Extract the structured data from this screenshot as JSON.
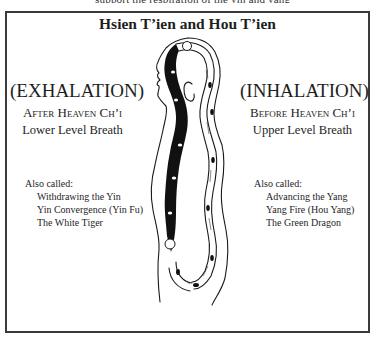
{
  "top_cut_text": "support the respiration of the yin and yang",
  "title": "Hsien T’ien and Hou T’ien",
  "left": {
    "heading": "(EXHALATION)",
    "subheading": "After Heaven Ch’i",
    "description": "Lower Level Breath",
    "also_called_label": "Also called:",
    "also_called": [
      "Withdrawing the Yin",
      "Yin Convergence (Yin Fu)",
      "The White Tiger"
    ]
  },
  "right": {
    "heading": "(INHALATION)",
    "subheading": "Before Heaven Ch’i",
    "description": "Upper Level Breath",
    "also_called_label": "Also called:",
    "also_called": [
      "Advancing the Yang",
      "Yang Fire (Hou Yang)",
      "The Green Dragon"
    ]
  },
  "figure": {
    "channels": [
      {
        "name": "front-channel-dark",
        "fill": "#111111"
      },
      {
        "name": "back-channel-light",
        "fill": "#ffffff"
      }
    ],
    "colors": {
      "ink": "#1a1a1a",
      "frame": "#3a3a3a",
      "background": "#ffffff"
    }
  }
}
